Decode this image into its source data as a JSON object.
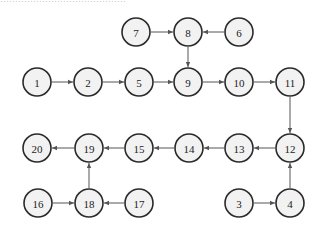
{
  "caption": "……………………………………",
  "colors": {
    "node_fill": "#f2f2f2",
    "node_stroke": "#2a2a2a",
    "edge": "#555555"
  },
  "node_radius": 14,
  "nodes": [
    {
      "id": "7",
      "label": "7",
      "x": 136,
      "y": 32
    },
    {
      "id": "8",
      "label": "8",
      "x": 188,
      "y": 32
    },
    {
      "id": "6",
      "label": "6",
      "x": 239,
      "y": 32
    },
    {
      "id": "1",
      "label": "1",
      "x": 37,
      "y": 82
    },
    {
      "id": "2",
      "label": "2",
      "x": 88,
      "y": 82
    },
    {
      "id": "5",
      "label": "5",
      "x": 139,
      "y": 82
    },
    {
      "id": "9",
      "label": "9",
      "x": 188,
      "y": 82
    },
    {
      "id": "10",
      "label": "10",
      "x": 239,
      "y": 82
    },
    {
      "id": "11",
      "label": "11",
      "x": 290,
      "y": 82
    },
    {
      "id": "20",
      "label": "20",
      "x": 37,
      "y": 148
    },
    {
      "id": "19",
      "label": "19",
      "x": 89,
      "y": 148
    },
    {
      "id": "15",
      "label": "15",
      "x": 139,
      "y": 148
    },
    {
      "id": "14",
      "label": "14",
      "x": 189,
      "y": 148
    },
    {
      "id": "13",
      "label": "13",
      "x": 239,
      "y": 148
    },
    {
      "id": "12",
      "label": "12",
      "x": 290,
      "y": 148
    },
    {
      "id": "16",
      "label": "16",
      "x": 38,
      "y": 203
    },
    {
      "id": "18",
      "label": "18",
      "x": 89,
      "y": 203
    },
    {
      "id": "17",
      "label": "17",
      "x": 139,
      "y": 203
    },
    {
      "id": "3",
      "label": "3",
      "x": 239,
      "y": 203
    },
    {
      "id": "4",
      "label": "4",
      "x": 290,
      "y": 203
    }
  ],
  "edges": [
    {
      "from": "7",
      "to": "8"
    },
    {
      "from": "6",
      "to": "8"
    },
    {
      "from": "8",
      "to": "9"
    },
    {
      "from": "1",
      "to": "2"
    },
    {
      "from": "2",
      "to": "5"
    },
    {
      "from": "5",
      "to": "9"
    },
    {
      "from": "9",
      "to": "10"
    },
    {
      "from": "10",
      "to": "11"
    },
    {
      "from": "11",
      "to": "12"
    },
    {
      "from": "4",
      "to": "12"
    },
    {
      "from": "3",
      "to": "4"
    },
    {
      "from": "12",
      "to": "13"
    },
    {
      "from": "13",
      "to": "14"
    },
    {
      "from": "14",
      "to": "15"
    },
    {
      "from": "15",
      "to": "19"
    },
    {
      "from": "19",
      "to": "20"
    },
    {
      "from": "18",
      "to": "19"
    },
    {
      "from": "16",
      "to": "18"
    },
    {
      "from": "17",
      "to": "18"
    }
  ]
}
